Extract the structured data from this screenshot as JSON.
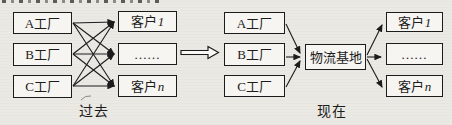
{
  "past": {
    "caption": "过去",
    "factories": [
      "A工厂",
      "B工厂",
      "C工厂"
    ],
    "customers": [
      {
        "base": "客户",
        "var": "1"
      },
      {
        "base": "……",
        "var": ""
      },
      {
        "base": "客户",
        "var": "n"
      }
    ]
  },
  "present": {
    "caption": "现在",
    "factories": [
      "A工厂",
      "B工厂",
      "C工厂"
    ],
    "hub": "物流基地",
    "customers": [
      {
        "base": "客户",
        "var": "1"
      },
      {
        "base": "……",
        "var": ""
      },
      {
        "base": "客户",
        "var": "n"
      }
    ]
  },
  "colors": {
    "ink": "#1c1c1c",
    "box_fill": "#f6f5f1",
    "background": "#eae9e4"
  }
}
